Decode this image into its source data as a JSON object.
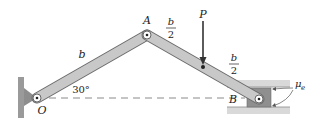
{
  "figure": {
    "type": "mechanics-linkage",
    "labels": {
      "pin_o": "O",
      "pin_a": "A",
      "pin_b": "B",
      "member_oa_length": "b",
      "segment_a_p_num": "b",
      "segment_a_p_den": "2",
      "segment_p_b_num": "b",
      "segment_p_b_den": "2",
      "load": "P",
      "angle": "30°",
      "friction_coeff": "μ",
      "friction_sub": "e"
    },
    "colors": {
      "member_fill": "#c8c8c8",
      "member_edge": "#6b6b6b",
      "support_fill": "#9a9a9a",
      "guide_fill": "#d9d9d9",
      "ink": "#222222"
    }
  }
}
